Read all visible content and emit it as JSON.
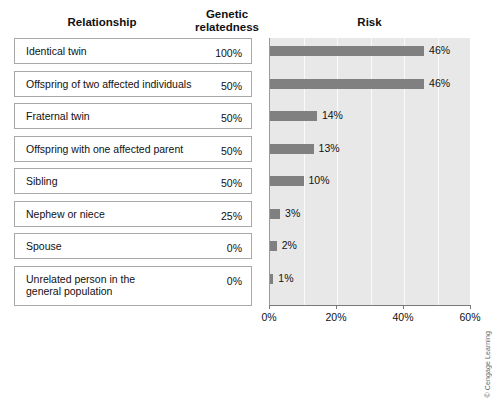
{
  "headers": {
    "relationship": "Relationship",
    "genetic_relatedness": "Genetic\nrelatedness",
    "risk": "Risk"
  },
  "rows": [
    {
      "relationship": "Identical twin",
      "relatedness": "100%",
      "risk_label": "46%",
      "risk": 46
    },
    {
      "relationship": "Offspring of two affected individuals",
      "relatedness": "50%",
      "risk_label": "46%",
      "risk": 46
    },
    {
      "relationship": "Fraternal twin",
      "relatedness": "50%",
      "risk_label": "14%",
      "risk": 14
    },
    {
      "relationship": "Offspring with one affected parent",
      "relatedness": "50%",
      "risk_label": "13%",
      "risk": 13
    },
    {
      "relationship": "Sibling",
      "relatedness": "50%",
      "risk_label": "10%",
      "risk": 10
    },
    {
      "relationship": "Nephew or niece",
      "relatedness": "25%",
      "risk_label": "3%",
      "risk": 3
    },
    {
      "relationship": "Spouse",
      "relatedness": "0%",
      "risk_label": "2%",
      "risk": 2
    },
    {
      "relationship": "Unrelated person in the\ngeneral population",
      "relatedness": "0%",
      "risk_label": "1%",
      "risk": 1
    }
  ],
  "chart_data": {
    "type": "bar",
    "orientation": "horizontal",
    "title": "Risk",
    "xlabel": "",
    "ylabel": "",
    "categories": [
      "Identical twin",
      "Offspring of two affected individuals",
      "Fraternal twin",
      "Offspring with one affected parent",
      "Sibling",
      "Nephew or niece",
      "Spouse",
      "Unrelated person in the general population"
    ],
    "values": [
      46,
      46,
      14,
      13,
      10,
      3,
      2,
      1
    ],
    "data_labels": [
      "46%",
      "46%",
      "14%",
      "13%",
      "10%",
      "3%",
      "2%",
      "1%"
    ],
    "secondary_series": {
      "name": "Genetic relatedness",
      "values": [
        100,
        50,
        50,
        50,
        50,
        25,
        0,
        0
      ],
      "labels": [
        "100%",
        "50%",
        "50%",
        "50%",
        "50%",
        "25%",
        "0%",
        "0%"
      ]
    },
    "xlim": [
      0,
      60
    ],
    "xticks": [
      0,
      20,
      40,
      60
    ],
    "xtick_labels": [
      "0%",
      "20%",
      "40%",
      "60%"
    ],
    "minor_gridlines_every": 10,
    "grid": true,
    "legend": "none",
    "bar_color": "#808080",
    "plot_background": "#e8e8e8",
    "gridline_color": "#fafafa"
  },
  "credit": "© Cengage Learning"
}
